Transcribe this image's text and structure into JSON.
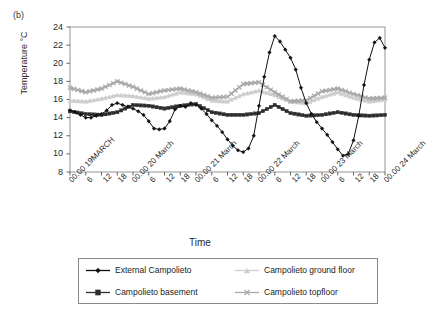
{
  "panel": {
    "label": "(b)"
  },
  "chart_data": {
    "type": "line",
    "title": "",
    "xlabel": "Time",
    "ylabel": "Temperature °C",
    "ylim": [
      8,
      24
    ],
    "ytick_values": [
      8,
      10,
      12,
      14,
      16,
      18,
      20,
      22,
      24
    ],
    "ytick_labels": [
      "8",
      "10",
      "12",
      "14",
      "16",
      "18",
      "20",
      "22",
      "24"
    ],
    "grid": false,
    "legend_position": "below-plot",
    "x_day_labels": [
      "00.00 19MARCH",
      "00.00 20 March",
      "00.00 21 March",
      "00.00 22 March",
      "00.00 23 March",
      "00.00 24 March"
    ],
    "x_hour_labels": [
      "6",
      "12",
      "18"
    ],
    "x_axis_span_hours": 120,
    "series": [
      {
        "name": "External Campolieto",
        "marker": "diamond",
        "color": "#111111",
        "x_hours": [
          0,
          2,
          4,
          6,
          8,
          10,
          12,
          14,
          16,
          18,
          20,
          22,
          24,
          26,
          28,
          30,
          32,
          34,
          36,
          38,
          40,
          42,
          44,
          46,
          48,
          50,
          52,
          54,
          56,
          58,
          60,
          62,
          64,
          66,
          68,
          70,
          72,
          74,
          76,
          78,
          80,
          82,
          84,
          86,
          88,
          90,
          92,
          94,
          96,
          98,
          100,
          102,
          104,
          106,
          108,
          110,
          112,
          114,
          116,
          118,
          120
        ],
        "values": [
          14.8,
          14.6,
          14.3,
          14.0,
          14.0,
          14.2,
          14.4,
          14.8,
          15.4,
          15.6,
          15.4,
          15.2,
          15.0,
          14.7,
          14.3,
          13.6,
          12.8,
          12.7,
          12.8,
          13.6,
          14.9,
          15.3,
          15.2,
          15.6,
          15.4,
          15.0,
          14.4,
          13.7,
          13.1,
          12.4,
          11.6,
          10.9,
          10.4,
          10.2,
          10.6,
          12.0,
          15.3,
          18.5,
          21.2,
          23.0,
          22.4,
          21.5,
          20.6,
          19.3,
          17.3,
          15.6,
          14.4,
          13.5,
          12.8,
          12.1,
          11.3,
          10.5,
          9.8,
          10.0,
          11.5,
          14.2,
          17.6,
          20.4,
          22.3,
          22.8,
          21.7,
          20.5,
          19.0,
          17.3,
          15.9,
          14.8,
          14.0,
          13.4,
          12.9,
          12.5,
          12.2,
          13.3,
          15.6,
          18.3,
          20.5,
          22.2,
          21.4,
          20.3,
          19.5,
          18.2,
          16.4,
          14.8,
          13.7,
          13.6,
          13.8,
          13.9,
          14.0,
          14.1,
          14.0,
          13.9,
          13.8,
          13.7,
          13.8,
          13.9,
          14.0,
          14.0,
          13.9,
          13.8,
          13.7,
          13.8,
          13.9,
          13.8,
          13.7,
          13.8,
          13.9,
          13.8,
          13.7,
          13.8,
          13.9,
          13.8,
          13.7,
          13.8,
          13.9,
          13.8,
          13.7
        ]
      },
      {
        "name": "Campolieto basement",
        "marker": "square",
        "color": "#2e2e2e",
        "x_hours": [
          0,
          6,
          12,
          18,
          24,
          30,
          36,
          42,
          48,
          54,
          60,
          66,
          72,
          78,
          84,
          90,
          96,
          102,
          108,
          114,
          120
        ],
        "values": [
          14.7,
          14.4,
          14.3,
          14.6,
          15.4,
          15.3,
          15.0,
          15.3,
          15.5,
          14.6,
          14.3,
          14.3,
          14.5,
          15.4,
          14.5,
          14.2,
          14.3,
          14.6,
          14.3,
          14.2,
          14.3
        ]
      },
      {
        "name": "Campolieto ground floor",
        "marker": "triangle",
        "color": "#cdcdcd",
        "x_hours": [
          0,
          6,
          12,
          18,
          24,
          30,
          36,
          42,
          48,
          54,
          60,
          66,
          72,
          78,
          84,
          90,
          96,
          102,
          108,
          114,
          120
        ],
        "values": [
          15.9,
          15.8,
          16.1,
          16.5,
          16.4,
          16.1,
          16.3,
          16.8,
          16.6,
          15.9,
          15.8,
          16.6,
          17.0,
          16.5,
          15.8,
          15.6,
          16.3,
          16.8,
          16.2,
          15.8,
          16.0
        ]
      },
      {
        "name": "Campolieto topfloor",
        "marker": "x",
        "color": "#a8a8a8",
        "x_hours": [
          0,
          6,
          12,
          18,
          24,
          30,
          36,
          42,
          48,
          54,
          60,
          66,
          72,
          78,
          84,
          90,
          96,
          102,
          108,
          114,
          120
        ],
        "values": [
          17.3,
          16.8,
          17.2,
          18.0,
          17.4,
          16.6,
          17.0,
          17.2,
          16.8,
          16.2,
          16.3,
          17.7,
          17.9,
          16.8,
          15.8,
          15.9,
          16.9,
          17.2,
          16.6,
          16.1,
          16.2
        ]
      }
    ]
  },
  "legend": {
    "items": [
      {
        "label": "External Campolieto",
        "marker": "diamond",
        "color": "#111111"
      },
      {
        "label": "Campolieto basement",
        "marker": "square",
        "color": "#2e2e2e"
      },
      {
        "label": "Campolieto ground floor",
        "marker": "triangle",
        "color": "#cdcdcd"
      },
      {
        "label": "Campolieto topfloor",
        "marker": "x",
        "color": "#a8a8a8"
      }
    ]
  }
}
